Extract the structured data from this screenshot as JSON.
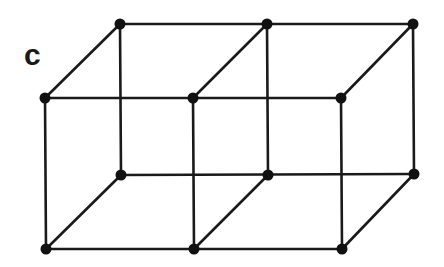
{
  "diagram": {
    "panel_label": "c",
    "type": "lattice-two-adjacent-cubes",
    "line_color": "#1a1a1a",
    "node_color": "#111111",
    "nodes": {
      "back_top": [
        [
          120,
          24
        ],
        [
          267,
          24
        ],
        [
          413,
          24
        ]
      ],
      "back_bottom": [
        [
          121,
          175
        ],
        [
          268,
          175
        ],
        [
          414,
          174
        ]
      ],
      "front_top": [
        [
          45,
          98
        ],
        [
          193,
          98
        ],
        [
          341,
          98
        ]
      ],
      "front_bottom": [
        [
          46,
          249
        ],
        [
          194,
          249
        ],
        [
          342,
          249
        ]
      ]
    }
  }
}
